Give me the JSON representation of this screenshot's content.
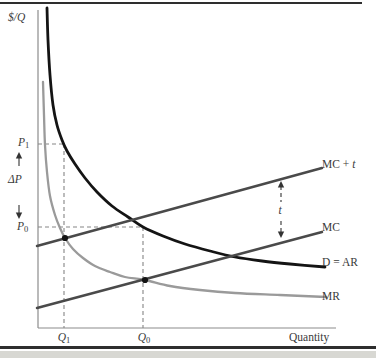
{
  "figure": {
    "y_axis_label": "$/Q",
    "x_axis_label": "Quantity",
    "labels": {
      "p1": {
        "main": "P",
        "sub": "1"
      },
      "dp": "ΔP",
      "p0": {
        "main": "P",
        "sub": "0"
      },
      "q1": {
        "main": "Q",
        "sub": "1"
      },
      "q0": {
        "main": "Q",
        "sub": "0"
      },
      "mc_t": {
        "pre": "MC + ",
        "it": "t"
      },
      "mc": "MC",
      "d_ar": "D = AR",
      "mr": "MR",
      "t": "t"
    }
  },
  "colors": {
    "demand": "#141414",
    "mr": "#9a9a9a",
    "mc": "#4a4a4a",
    "guide": "#858585",
    "axis": "#8c8c8c",
    "arrow": "#333333",
    "text": "#3a3a3a",
    "rule": "#2e2e2e",
    "strip": "#d8d8d3"
  },
  "chart_data": {
    "type": "line",
    "xlabel": "Quantity",
    "ylabel": "$/Q",
    "axes_px": {
      "origin_x": 38,
      "origin_y": 328,
      "top_y": 10,
      "right_x": 336
    },
    "x_tick_labels": [
      {
        "label": "Q1",
        "x": 64
      },
      {
        "label": "Q0",
        "x": 143
      }
    ],
    "y_tick_labels": [
      {
        "label": "P1",
        "y": 144
      },
      {
        "label": "P0",
        "y": 227
      }
    ],
    "series": [
      {
        "name": "D = AR",
        "kind": "curve",
        "color": "#141414",
        "width": 2.8,
        "points": [
          [
            47,
            8
          ],
          [
            48,
            40
          ],
          [
            50,
            75
          ],
          [
            53,
            105
          ],
          [
            57,
            125
          ],
          [
            62,
            140
          ],
          [
            67,
            151
          ],
          [
            75,
            164
          ],
          [
            85,
            178
          ],
          [
            97,
            192
          ],
          [
            112,
            206
          ],
          [
            128,
            217
          ],
          [
            143,
            227
          ],
          [
            163,
            236
          ],
          [
            185,
            244
          ],
          [
            210,
            251
          ],
          [
            235,
            257
          ],
          [
            262,
            261
          ],
          [
            290,
            264
          ],
          [
            325,
            267
          ]
        ]
      },
      {
        "name": "MR",
        "kind": "curve",
        "color": "#9a9a9a",
        "width": 2.3,
        "points": [
          [
            43,
            82
          ],
          [
            44,
            115
          ],
          [
            45,
            145
          ],
          [
            47,
            172
          ],
          [
            50,
            196
          ],
          [
            55,
            215
          ],
          [
            60,
            228
          ],
          [
            65,
            238
          ],
          [
            73,
            249
          ],
          [
            83,
            258
          ],
          [
            95,
            266
          ],
          [
            110,
            272
          ],
          [
            125,
            277
          ],
          [
            145,
            280
          ],
          [
            170,
            286
          ],
          [
            200,
            290
          ],
          [
            235,
            293
          ],
          [
            280,
            295
          ],
          [
            326,
            297
          ]
        ]
      },
      {
        "name": "MC",
        "kind": "line",
        "color": "#4a4a4a",
        "width": 2.5,
        "points": [
          [
            37,
            308
          ],
          [
            322,
            232
          ]
        ]
      },
      {
        "name": "MC + t",
        "kind": "line",
        "color": "#4a4a4a",
        "width": 2.5,
        "points": [
          [
            37,
            246
          ],
          [
            322,
            168
          ]
        ]
      }
    ],
    "intersection_points": [
      {
        "name": "MC+t = MR",
        "x": 65,
        "y": 238
      },
      {
        "name": "MC = MR",
        "x": 145,
        "y": 280
      }
    ],
    "guide_lines": [
      {
        "name": "p1-horizontal",
        "x1": 38,
        "y1": 144,
        "x2": 64,
        "y2": 144
      },
      {
        "name": "q1-vertical",
        "x1": 64,
        "y1": 144,
        "x2": 64,
        "y2": 328
      },
      {
        "name": "p0-horizontal",
        "x1": 38,
        "y1": 227,
        "x2": 143,
        "y2": 227
      },
      {
        "name": "q0-vertical",
        "x1": 143,
        "y1": 227,
        "x2": 143,
        "y2": 328
      }
    ],
    "t_arrow": {
      "x": 281,
      "top": 181,
      "bottom": 238,
      "gap_top": 202,
      "gap_bottom": 221
    },
    "dp_arrows": {
      "x": 19,
      "up_tip": 152,
      "up_tail": 166,
      "down_tip": 219,
      "down_tail": 205
    },
    "legend": "labels at right end of each curve",
    "grid": false
  }
}
